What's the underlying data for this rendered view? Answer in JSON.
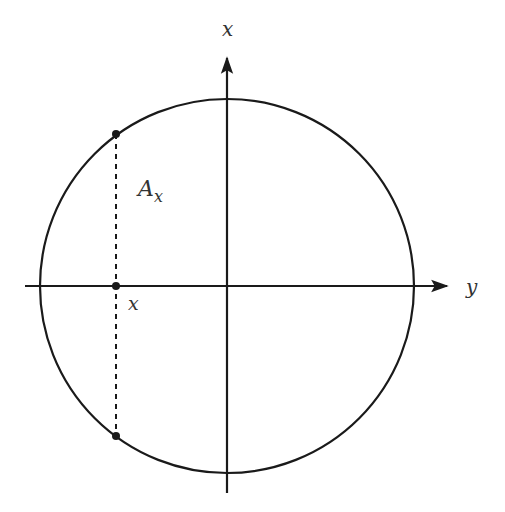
{
  "diagram": {
    "colors": {
      "stroke": "#1a1a1a",
      "text": "#333333",
      "background": "#ffffff"
    },
    "circle": {
      "cx": 227,
      "cy": 286,
      "r": 188
    },
    "axes": {
      "horizontal": {
        "x1": 25,
        "x2": 445,
        "y": 286,
        "label": "y"
      },
      "vertical": {
        "x": 227,
        "y1": 493,
        "y2": 62,
        "label": "x"
      }
    },
    "chord": {
      "x": 116,
      "y_top": 134,
      "y_bottom": 436,
      "style": "dashed"
    },
    "points": [
      {
        "name": "top-point",
        "x": 116,
        "y": 134
      },
      {
        "name": "axis-point",
        "x": 116,
        "y": 286
      },
      {
        "name": "bottom-point",
        "x": 116,
        "y": 436
      }
    ],
    "labels": {
      "vertical_axis": "x",
      "horizontal_axis": "y",
      "chord_label_main": "A",
      "chord_label_sub": "x",
      "point_label": "x"
    }
  }
}
